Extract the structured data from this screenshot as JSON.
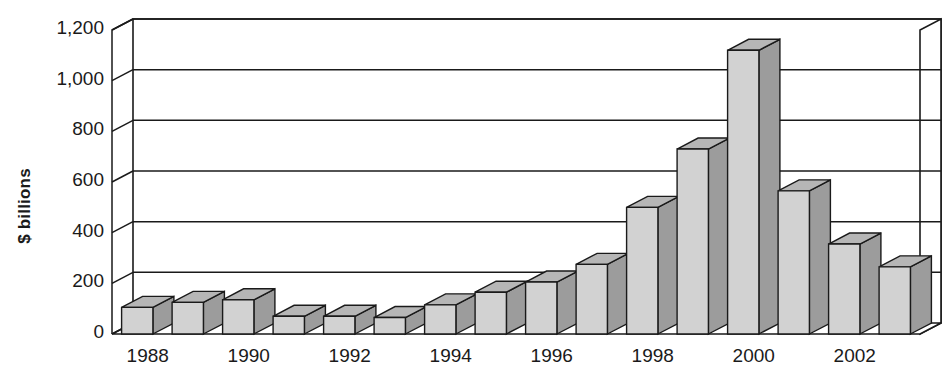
{
  "chart_data": {
    "type": "bar",
    "title": "",
    "subtitle": "",
    "xlabel": "",
    "ylabel": "$ billions",
    "ylim": [
      0,
      1200
    ],
    "ytick_step": 200,
    "ytick_labels": [
      "1,200",
      "1,000",
      "800",
      "600",
      "400",
      "200",
      "0"
    ],
    "ytick_values": [
      1200,
      1000,
      800,
      600,
      400,
      200,
      0
    ],
    "grid": true,
    "legend": null,
    "style": "3d-column",
    "categories": [
      "1988",
      "1989",
      "1990",
      "1991",
      "1992",
      "1993",
      "1994",
      "1995",
      "1996",
      "1997",
      "1998",
      "1999",
      "2000",
      "2001",
      "2002",
      "2003"
    ],
    "xtick_labels": [
      "1988",
      "1990",
      "1992",
      "1994",
      "1996",
      "1998",
      "2000",
      "2002"
    ],
    "xtick_label_every": 2,
    "values": [
      105,
      125,
      135,
      70,
      70,
      65,
      115,
      165,
      205,
      275,
      500,
      730,
      1120,
      565,
      355,
      265
    ],
    "colors": {
      "bar_front": "#d2d2d2",
      "bar_side": "#9c9c9c",
      "bar_top": "#b6b6b6",
      "outline": "#1a1a1a",
      "background": "#ffffff"
    }
  }
}
